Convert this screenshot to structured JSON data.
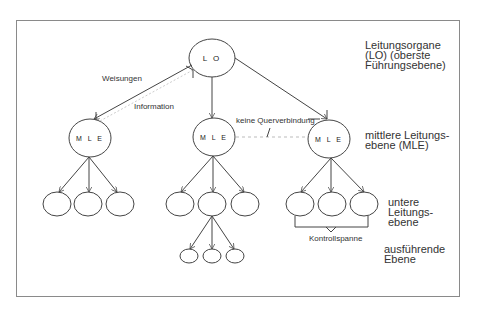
{
  "diagram": {
    "type": "organization-hierarchy",
    "top_node": {
      "label": "L O"
    },
    "middle_nodes": [
      {
        "label": "M L E"
      },
      {
        "label": "M L E"
      },
      {
        "label": "M L E"
      }
    ],
    "edge_labels": {
      "weisungen": "Weisungen",
      "information": "Information",
      "keine_querverbindung": "keine Querverbindung",
      "kontrollspanne": "Kontrollspanne"
    },
    "level_labels": {
      "lo": [
        "Leitungsorgane",
        "(LO) (oberste",
        "Führungsebene)"
      ],
      "mle": [
        "mittlere Leitungs-",
        "ebene (MLE)"
      ],
      "untere": [
        "untere",
        "Leitungs-",
        "ebene"
      ],
      "ausfuehrende": [
        "ausführende",
        "Ebene"
      ]
    }
  }
}
